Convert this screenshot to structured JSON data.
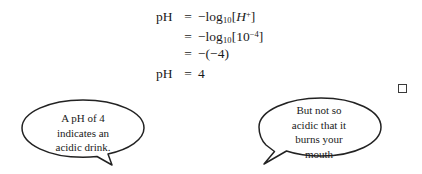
{
  "document": {
    "equations": [
      {
        "lhs": "pH",
        "relation": "=",
        "rhs_prefix": "−log",
        "rhs_sub": "10",
        "rhs_open": "[",
        "rhs_var": "H",
        "rhs_sup": "+",
        "rhs_close": "]",
        "plain": "pH = −log10[H+]"
      },
      {
        "lhs": "",
        "relation": "=",
        "rhs_prefix": "−log",
        "rhs_sub": "10",
        "rhs_open": "[10",
        "rhs_sup": "−4",
        "rhs_close": "]",
        "plain": "= −log10[10−4]"
      },
      {
        "lhs": "",
        "relation": "=",
        "rhs_plain": "−(−4)",
        "plain": "= −(−4)"
      },
      {
        "lhs": "pH",
        "relation": "=",
        "rhs_plain": "4",
        "plain": "pH = 4"
      }
    ],
    "bubbles": {
      "left": {
        "name": "acidic-drink-callout",
        "lines": [
          "A pH of 4",
          "indicates an",
          "acidic drink."
        ],
        "tail": "bottom-right"
      },
      "right": {
        "name": "not-so-acidic-callout",
        "lines": [
          "But not so",
          "acidic that it",
          "burns your",
          "mouth"
        ],
        "tail": "bottom-left"
      }
    },
    "marks": {
      "open_square": {
        "name": "open-square-glyph",
        "symbol": "□"
      }
    },
    "colors": {
      "ink": "#1a1a1a",
      "stroke": "#222222",
      "background": "#ffffff"
    }
  }
}
